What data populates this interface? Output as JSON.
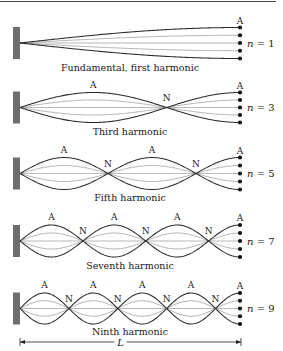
{
  "figure": {
    "type": "standing-waves-closed-open-tube",
    "top_rule": true,
    "colors": {
      "wall": "#6e6e6e",
      "outer_curve": "#2b2b2b",
      "inner_curve": "#9a9a9a",
      "dot": "#111111",
      "text": "#1a1a1a"
    },
    "geometry": {
      "x_start": 20,
      "x_end": 240,
      "wall_left": 13,
      "wall_width": 7
    },
    "panels": [
      {
        "id": "n1",
        "caption": "Fundamental, first harmonic",
        "n_label": "n = 1",
        "n_var": "n",
        "n_value": "1",
        "cy": 43,
        "amp": 15.5,
        "half_loops": 1,
        "antinode_labels": [
          "A"
        ],
        "node_labels": [],
        "caption_y": 71
      },
      {
        "id": "n3",
        "caption": "Third harmonic",
        "n_label": "n = 3",
        "n_var": "n",
        "n_value": "3",
        "cy": 107.5,
        "amp": 15,
        "half_loops": 3,
        "antinode_labels": [
          "A",
          "A"
        ],
        "node_labels": [
          "N"
        ],
        "caption_y": 135
      },
      {
        "id": "n5",
        "caption": "Fifth harmonic",
        "n_label": "n = 5",
        "n_var": "n",
        "n_value": "5",
        "cy": 173.5,
        "amp": 16,
        "half_loops": 5,
        "antinode_labels": [
          "A",
          "A",
          "A"
        ],
        "node_labels": [
          "N",
          "N"
        ],
        "caption_y": 201
      },
      {
        "id": "n7",
        "caption": "Seventh harmonic",
        "n_label": "n = 7",
        "n_var": "n",
        "n_value": "7",
        "cy": 241,
        "amp": 16,
        "half_loops": 7,
        "antinode_labels": [
          "A",
          "A",
          "A",
          "A"
        ],
        "node_labels": [
          "N",
          "N",
          "N"
        ],
        "caption_y": 269
      },
      {
        "id": "n9",
        "caption": "Ninth harmonic",
        "n_label": "n = 9",
        "n_var": "n",
        "n_value": "9",
        "cy": 308.5,
        "amp": 15.5,
        "half_loops": 9,
        "antinode_labels": [
          "A",
          "A",
          "A",
          "A",
          "A"
        ],
        "node_labels": [
          "N",
          "N",
          "N",
          "N"
        ],
        "caption_y": 335
      }
    ],
    "length_marker": {
      "label": "L",
      "y": 342,
      "x_from": 20,
      "x_to": 241
    }
  }
}
